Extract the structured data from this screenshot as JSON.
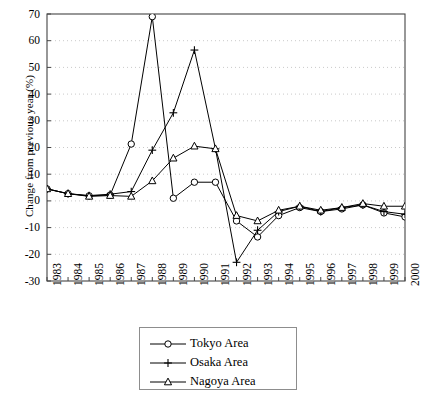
{
  "chart_data": {
    "type": "line",
    "title": "",
    "xlabel": "",
    "ylabel": "Change from previous year (%)",
    "categories": [
      "1983",
      "1984",
      "1985",
      "1986",
      "1987",
      "1988",
      "1989",
      "1990",
      "1991",
      "1992",
      "1993",
      "1994",
      "1995",
      "1996",
      "1997",
      "1998",
      "1999",
      "2000"
    ],
    "x": [
      1983,
      1984,
      1985,
      1986,
      1987,
      1988,
      1989,
      1990,
      1991,
      1992,
      1993,
      1994,
      1995,
      1996,
      1997,
      1998,
      1999,
      2000
    ],
    "ylim": [
      -30,
      70
    ],
    "ytick_values": [
      -30,
      -20,
      -10,
      0,
      10,
      20,
      30,
      40,
      50,
      60,
      70
    ],
    "ytick_labels": [
      "-30",
      "-20",
      "-10",
      "0",
      "10",
      "20",
      "30",
      "40",
      "50",
      "60",
      "70"
    ],
    "grid": true,
    "grid_style": "dotted-horizontal",
    "legend_position": "below-center",
    "series": [
      {
        "name": "Tokyo Area",
        "marker": "circle",
        "values": [
          4.5,
          2.7,
          1.9,
          2.2,
          21.3,
          69.0,
          1.0,
          7.0,
          7.0,
          -7.5,
          -13.5,
          -5.5,
          -2.5,
          -4.0,
          -3.0,
          -1.5,
          -4.5,
          -6.0
        ]
      },
      {
        "name": "Osaka Area",
        "marker": "plus",
        "values": [
          4.5,
          2.7,
          2.0,
          2.5,
          3.5,
          19.0,
          33.0,
          56.5,
          19.5,
          -23.0,
          -11.0,
          -4.0,
          -2.0,
          -4.0,
          -2.5,
          -1.5,
          -4.0,
          -5.0
        ]
      },
      {
        "name": "Nagoya Area",
        "marker": "triangle",
        "values": [
          4.5,
          2.7,
          1.7,
          2.0,
          1.7,
          7.5,
          16.0,
          20.5,
          19.5,
          -5.5,
          -7.5,
          -3.5,
          -2.0,
          -3.5,
          -2.5,
          -1.0,
          -2.0,
          -2.0
        ]
      }
    ]
  },
  "legend": {
    "items": [
      {
        "label": "Tokyo Area",
        "marker": "circle"
      },
      {
        "label": "Osaka Area",
        "marker": "plus"
      },
      {
        "label": "Nagoya Area",
        "marker": "triangle"
      }
    ]
  },
  "colors": {
    "line": "#000000",
    "axis": "#444444",
    "grid": "#bbbbbb",
    "background": "#ffffff"
  }
}
